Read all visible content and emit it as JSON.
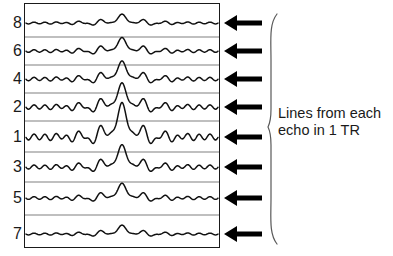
{
  "figure": {
    "background_color": "#ffffff",
    "stroke_color": "#1a1a1a",
    "divider_color": "#808080"
  },
  "kspace_box": {
    "x": 24,
    "y": 3,
    "width": 196,
    "height": 245,
    "border_color": "#1a1a1a",
    "border_width": 1.6
  },
  "rows": [
    {
      "label": "8",
      "center_y": 23,
      "amplitude": 3.0,
      "peak_amplitude": 5,
      "ripple": 0.9
    },
    {
      "label": "6",
      "center_y": 51,
      "amplitude": 4.2,
      "peak_amplitude": 8,
      "ripple": 1.3
    },
    {
      "label": "4",
      "center_y": 79,
      "amplitude": 5.4,
      "peak_amplitude": 11,
      "ripple": 1.7
    },
    {
      "label": "2",
      "center_y": 107,
      "amplitude": 7.0,
      "peak_amplitude": 15,
      "ripple": 2.2
    },
    {
      "label": "1",
      "center_y": 137,
      "amplitude": 9.5,
      "peak_amplitude": 22,
      "ripple": 3.0
    },
    {
      "label": "3",
      "center_y": 167,
      "amplitude": 6.4,
      "peak_amplitude": 14,
      "ripple": 2.0
    },
    {
      "label": "5",
      "center_y": 198,
      "amplitude": 4.4,
      "peak_amplitude": 9,
      "ripple": 1.4
    },
    {
      "label": "7",
      "center_y": 234,
      "amplitude": 3.0,
      "peak_amplitude": 5,
      "ripple": 0.9
    }
  ],
  "dividers": [
    {
      "y": 37
    },
    {
      "y": 65
    },
    {
      "y": 93
    },
    {
      "y": 121
    },
    {
      "y": 152
    },
    {
      "y": 182
    },
    {
      "y": 215
    }
  ],
  "arrows": [
    {
      "y": 23
    },
    {
      "y": 51
    },
    {
      "y": 79
    },
    {
      "y": 107
    },
    {
      "y": 137
    },
    {
      "y": 167
    },
    {
      "y": 198
    },
    {
      "y": 234
    }
  ],
  "arrow_style": {
    "tail_x": 262,
    "tip_x": 224,
    "shaft_width": 5,
    "head_length": 13,
    "head_half_height": 8,
    "color": "#000000",
    "direction": "left"
  },
  "brace": {
    "x": 268,
    "top_y": 14,
    "bottom_y": 244,
    "tip_y": 127,
    "color": "#595959",
    "stroke_width": 1.2,
    "orientation": "left-pointing"
  },
  "annotation": {
    "line1": "Lines from each",
    "line2": "echo in 1 TR",
    "font_size_px": 14.5,
    "color": "#1a1a1a"
  },
  "waveform": {
    "x_start": 26,
    "x_end": 218,
    "peak_center_x": 122,
    "peak_sigma": 9,
    "base_period": 11,
    "samples": 420,
    "stroke_width": 1.5,
    "color": "#111111"
  }
}
